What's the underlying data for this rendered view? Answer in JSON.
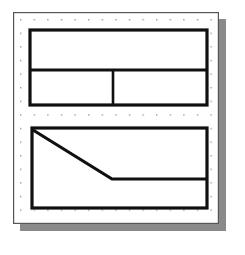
{
  "canvas": {
    "width": 245,
    "height": 255,
    "background_color": "#ffffff",
    "title": "Grid paper floor plan sketch"
  },
  "sheet": {
    "label": "grid-sheet",
    "x": 13,
    "y": 12,
    "width": 206,
    "height": 212,
    "fill_color": "#ffffff",
    "border_color": "#555555",
    "border_width": 1.2,
    "shadow": {
      "label": "sheet-drop-shadow",
      "offset_x": 7,
      "offset_y": 7,
      "color": "#8a8a8a"
    }
  },
  "grid": {
    "label": "dot-grid",
    "spacing": 13.6,
    "origin_x": 20,
    "origin_y": 19,
    "dot_size": 1.4,
    "dot_color": "#9a9a9a",
    "columns": 15,
    "rows": 15
  },
  "shapes": {
    "upper_block": {
      "label": "upper-room-block",
      "x": 30,
      "y": 30,
      "width": 177,
      "height": 75,
      "stroke_color": "#101010",
      "stroke_width": 3.2,
      "fill": "none",
      "dividers": [
        {
          "label": "upper-horizontal-divider",
          "orientation": "horizontal",
          "x1": 30,
          "y1": 70,
          "x2": 207,
          "y2": 70
        },
        {
          "label": "upper-vertical-divider",
          "orientation": "vertical",
          "x1": 113,
          "y1": 70,
          "x2": 113,
          "y2": 105
        }
      ]
    },
    "lower_block": {
      "label": "lower-room-block",
      "x": 32,
      "y": 128,
      "width": 175,
      "height": 80,
      "stroke_color": "#101010",
      "stroke_width": 3.2,
      "fill": "none",
      "diagonal": {
        "label": "lower-diagonal-wall",
        "points": "33,130 112,179 207,179",
        "start_x": 33,
        "start_y": 130,
        "vertex_x": 112,
        "vertex_y": 179,
        "end_x": 207,
        "end_y": 179
      }
    }
  }
}
